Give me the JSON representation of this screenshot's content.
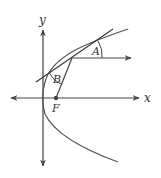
{
  "diagram": {
    "labels": {
      "y_axis": "y",
      "x_axis": "x",
      "focus": "F",
      "angle_a": "A",
      "angle_b": "B"
    },
    "colors": {
      "stroke": "#444444",
      "text": "#333333",
      "background": "#ffffff"
    },
    "elements": [
      "x-axis (double arrow)",
      "y-axis (double arrow)",
      "parabola opening right",
      "focus point F",
      "tangent line at point on parabola",
      "horizontal ray from point of tangency",
      "segment from point to focus",
      "angle A between tangent and ray",
      "angle B between tangent and focal segment"
    ]
  }
}
